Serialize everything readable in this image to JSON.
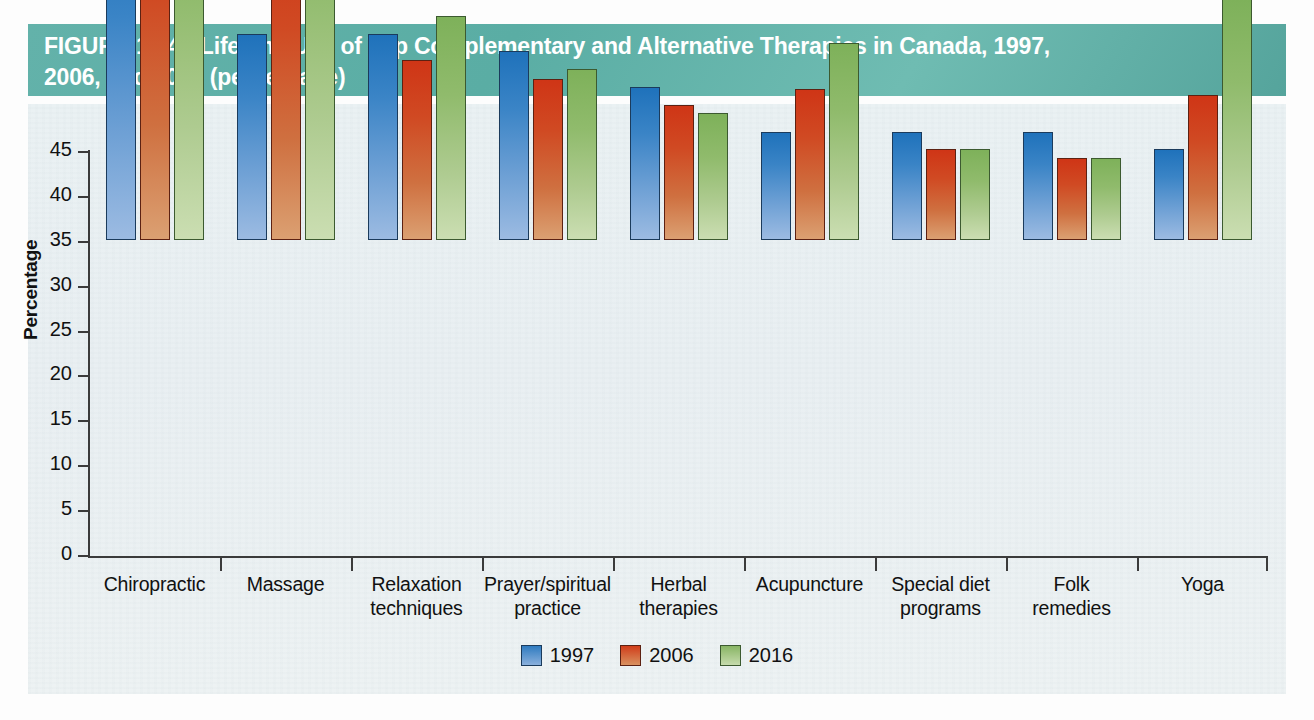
{
  "figure": {
    "number_label": "FIGURE 12.4",
    "title_line1": "Lifetime Use of Top Complementary and Alternative Therapies in Canada, 1997,",
    "title_line2": "2006, and 2016 (percentage)",
    "banner_color": "#5cada5"
  },
  "chart_data": {
    "type": "bar",
    "title": "Lifetime Use of Top Complementary and Alternative Therapies in Canada, 1997, 2006, and 2016 (percentage)",
    "xlabel": "",
    "ylabel": "Percentage",
    "ylim": [
      0,
      45
    ],
    "yticks": [
      "0",
      "5",
      "10",
      "15",
      "20",
      "25",
      "30",
      "35",
      "40",
      "45"
    ],
    "ytick_values": [
      0,
      5,
      10,
      15,
      20,
      25,
      30,
      35,
      40,
      45
    ],
    "grid": false,
    "legend_position": "bottom-center",
    "categories": [
      "Chiropractic",
      "Massage",
      "Relaxation techniques",
      "Prayer/spiritual practice",
      "Herbal therapies",
      "Acupuncture",
      "Special diet programs",
      "Folk remedies",
      "Yoga"
    ],
    "category_lines": [
      [
        "Chiropractic"
      ],
      [
        "Massage"
      ],
      [
        "Relaxation",
        "techniques"
      ],
      [
        "Prayer/spiritual",
        "practice"
      ],
      [
        "Herbal",
        "therapies"
      ],
      [
        "Acupuncture"
      ],
      [
        "Special diet",
        "programs"
      ],
      [
        "Folk",
        "remedies"
      ],
      [
        "Yoga"
      ]
    ],
    "series": [
      {
        "name": "1997",
        "color": "#2f7bc0",
        "values": [
          35.6,
          23.0,
          22.9,
          21.0,
          17.0,
          12.0,
          12.0,
          12.0,
          10.1
        ]
      },
      {
        "name": "2006",
        "color": "#d03d1a",
        "values": [
          39.8,
          34.8,
          20.0,
          17.9,
          15.0,
          16.8,
          10.1,
          9.1,
          16.1
        ]
      },
      {
        "name": "2016",
        "color": "#88b564",
        "values": [
          42.0,
          43.9,
          25.0,
          19.0,
          14.2,
          21.9,
          10.1,
          9.1,
          26.9
        ]
      }
    ]
  }
}
